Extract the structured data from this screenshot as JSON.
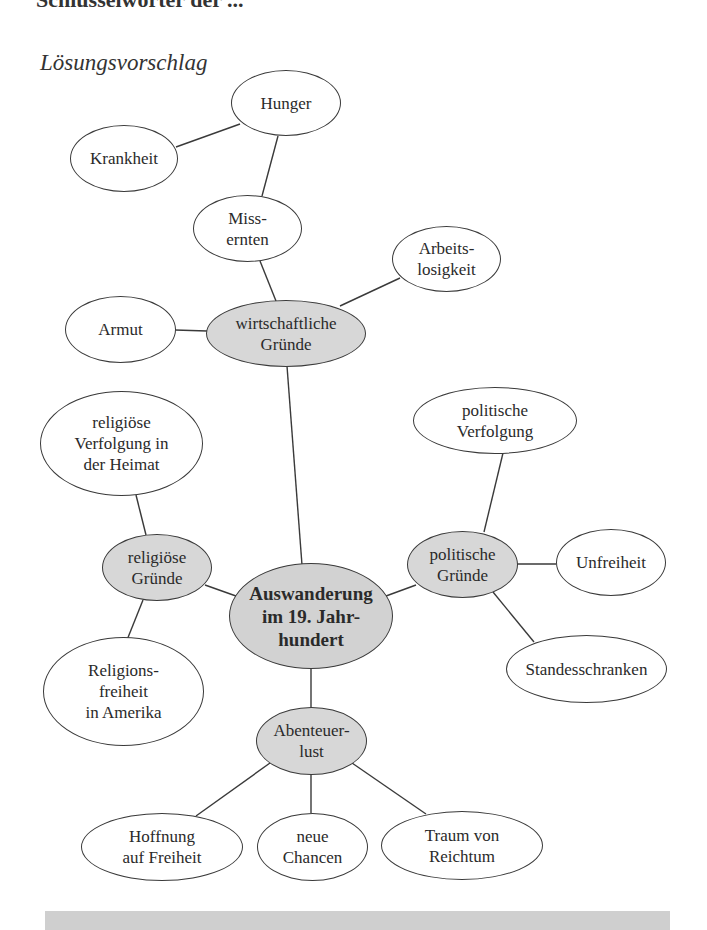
{
  "header": {
    "clipped_title": "Schlüsselwörter der ..."
  },
  "subtitle": "Lösungsvorschlag",
  "mindmap": {
    "center": {
      "id": "center",
      "label": "Auswanderung\nim 19. Jahr-\nhundert"
    },
    "hubs": [
      {
        "id": "wirtschaft",
        "label": "wirtschaftliche\nGründe"
      },
      {
        "id": "religion",
        "label": "religiöse\nGründe"
      },
      {
        "id": "politik",
        "label": "politische\nGründe"
      },
      {
        "id": "abenteuer",
        "label": "Abenteuer-\nlust"
      }
    ],
    "leaves": [
      {
        "id": "hunger",
        "parent": "missernten",
        "label": "Hunger"
      },
      {
        "id": "krankheit",
        "parent": "hunger",
        "label": "Krankheit"
      },
      {
        "id": "missernten",
        "parent": "wirtschaft",
        "label": "Miss-\nernten"
      },
      {
        "id": "arbeitslosigkeit",
        "parent": "wirtschaft",
        "label": "Arbeits-\nlosigkeit"
      },
      {
        "id": "armut",
        "parent": "wirtschaft",
        "label": "Armut"
      },
      {
        "id": "rel_verfolgung",
        "parent": "religion",
        "label": "religiöse\nVerfolgung in\nder Heimat"
      },
      {
        "id": "religionsfreiheit",
        "parent": "religion",
        "label": "Religions-\nfreiheit\nin Amerika"
      },
      {
        "id": "pol_verfolgung",
        "parent": "politik",
        "label": "politische\nVerfolgung"
      },
      {
        "id": "unfreiheit",
        "parent": "politik",
        "label": "Unfreiheit"
      },
      {
        "id": "standesschranken",
        "parent": "politik",
        "label": "Standesschranken"
      },
      {
        "id": "hoffnung",
        "parent": "abenteuer",
        "label": "Hoffnung\nauf Freiheit"
      },
      {
        "id": "chancen",
        "parent": "abenteuer",
        "label": "neue\nChancen"
      },
      {
        "id": "reichtum",
        "parent": "abenteuer",
        "label": "Traum von\nReichtum"
      }
    ]
  },
  "colors": {
    "hub_fill": "#d7d7d7",
    "center_fill": "#d2d2d2",
    "stroke": "#3a3a3a",
    "footer_bar": "#cfcfcf"
  }
}
